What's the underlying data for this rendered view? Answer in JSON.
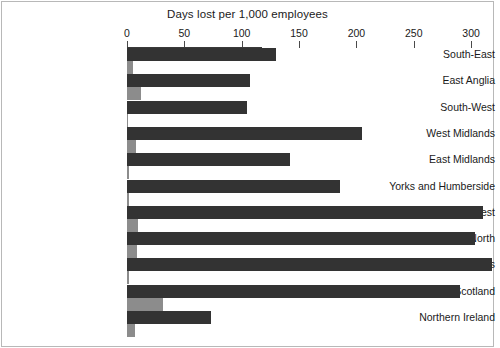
{
  "chart_data": {
    "type": "bar",
    "orientation": "horizontal",
    "title": "Days lost per 1,000 employees",
    "xlabel": "",
    "ylabel": "",
    "xlim": [
      0,
      320
    ],
    "grid": false,
    "legend": "none",
    "axis": {
      "ticks": [
        0,
        50,
        100,
        150,
        200,
        250,
        300
      ],
      "tick_labels": [
        "0",
        "50",
        "100",
        "150",
        "200",
        "250",
        "300"
      ]
    },
    "categories": [
      "South-East",
      "East Anglia",
      "South-West",
      "West Midlands",
      "East Midlands",
      "Yorks and Humberside",
      "North-West",
      "North",
      "Wales",
      "Scotland",
      "Northern Ireland"
    ],
    "series": [
      {
        "name": "primary",
        "color": "#333333",
        "values": [
          130,
          107,
          105,
          205,
          142,
          186,
          310,
          303,
          318,
          290,
          73
        ]
      },
      {
        "name": "secondary",
        "color": "#8c8c8c",
        "values": [
          5,
          12,
          1,
          8,
          2,
          2,
          10,
          9,
          2,
          31,
          7
        ]
      }
    ]
  },
  "colors": {
    "primary_bar": "#333333",
    "secondary_bar": "#8c8c8c",
    "axis": "#3a3a3a",
    "text": "#1a1a1a",
    "frame": "#b8b8b8",
    "background": "#ffffff"
  }
}
